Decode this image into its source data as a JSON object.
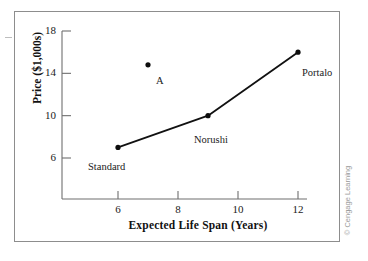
{
  "figure": {
    "credit": "© Cengage Learning"
  },
  "chart_data": {
    "type": "scatter",
    "title": "",
    "xlabel": "Expected Life Span (Years)",
    "ylabel": "Price ($1,000s)",
    "xlim": [
      4.6,
      12.6
    ],
    "ylim": [
      2.2,
      18
    ],
    "grid": false,
    "legend": "none",
    "xticks": [
      6,
      8,
      10,
      12
    ],
    "xtick_labels": [
      "6",
      "8",
      "10",
      "12"
    ],
    "yticks": [
      6,
      10,
      14,
      18
    ],
    "ytick_labels": [
      "6",
      "10",
      "14",
      "18"
    ],
    "series": [
      {
        "name": "efficient-frontier",
        "connected": true,
        "points": [
          {
            "label": "Standard",
            "x": 6,
            "y": 7,
            "label_dx": -30,
            "label_dy": 14
          },
          {
            "label": "Norushi",
            "x": 9,
            "y": 10,
            "label_dx": -14,
            "label_dy": 18
          },
          {
            "label": "Portalo",
            "x": 12,
            "y": 16,
            "label_dx": 4,
            "label_dy": 15
          }
        ]
      },
      {
        "name": "dominated-option",
        "connected": false,
        "points": [
          {
            "label": "A",
            "x": 7,
            "y": 14.8,
            "label_dx": 8,
            "label_dy": 10
          }
        ]
      }
    ]
  }
}
